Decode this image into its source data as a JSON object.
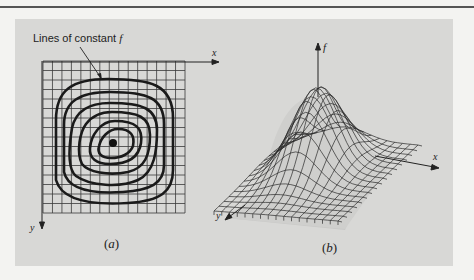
{
  "figure": {
    "panel_a": {
      "annotation": "Lines of constant",
      "annotation_var": "f",
      "x_axis_label": "x",
      "y_axis_label": "y",
      "caption": "(a)",
      "grid": {
        "columns": 15,
        "rows": 16
      },
      "contour_count": 6,
      "center_marker": "maximum-point"
    },
    "panel_b": {
      "z_axis_label": "f",
      "x_axis_label": "x",
      "y_axis_label": "y",
      "caption": "(b)",
      "surface": "3D wireframe mesh of a single-peak hill"
    }
  },
  "colors": {
    "page_background": "#f3f3f1",
    "panel_background": "#d8d8d6",
    "ink": "#222222",
    "grid": "#3a3a3a"
  }
}
